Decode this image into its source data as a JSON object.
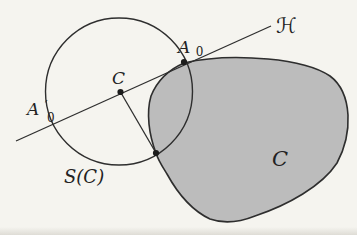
{
  "figure": {
    "colors": {
      "background": "#f5f4ef",
      "stroke": "#2e2e2e",
      "body_fill": "#bcbcbc",
      "dot": "#1c1c1c"
    },
    "labels": {
      "line": "ℋ",
      "point_a0": {
        "main": "A",
        "sub": "0"
      },
      "point_a0_prime": {
        "main": "A",
        "prime": "′",
        "sub": "0"
      },
      "center": "C",
      "circle": "S(C)",
      "body": "C"
    }
  }
}
